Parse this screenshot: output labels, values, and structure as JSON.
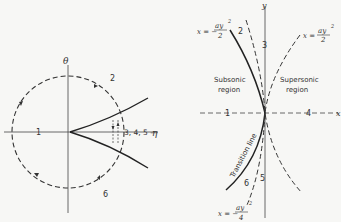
{
  "left_diagram": {
    "axis_labels": {
      "vertical": "θ",
      "horizontal": "η"
    },
    "region_labels": {
      "r1": "1",
      "r2": "2",
      "r345": "3, 4, 5 —",
      "r6": "6"
    }
  },
  "right_diagram": {
    "axis_labels": {
      "vertical": "y",
      "horizontal": "x"
    },
    "curve_labels": {
      "top_left": {
        "lhs": "x = −",
        "num": "ay",
        "exp": "2",
        "den": "2"
      },
      "top_right": {
        "lhs": "x =",
        "num": "ay",
        "exp": "2",
        "den": "2"
      },
      "bottom": {
        "lhs": "x = −",
        "num": "ay",
        "exp": "2",
        "den": "4"
      }
    },
    "region_numbers": {
      "r1": "1",
      "r2": "2",
      "r3": "3",
      "r4": "4",
      "r5": "5",
      "r6": "6"
    },
    "regions": {
      "subsonic_line1": "Subsonic",
      "subsonic_line2": "region",
      "supersonic_line1": "Supersonic",
      "supersonic_line2": "region"
    },
    "transition_label": "Transition line"
  },
  "colors": {
    "ink": "#333333",
    "background": "#f7f7f5"
  }
}
